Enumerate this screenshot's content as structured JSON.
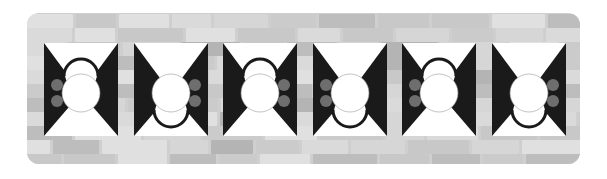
{
  "figure": {
    "colors": {
      "background": "#ffffff",
      "wall": "#cfcfcf",
      "tile": "#ffffff",
      "triangle": "#1a1a1a",
      "dot": "#6e6e6e",
      "circle": "#ffffff"
    }
  },
  "tiles": [
    {
      "index": 1,
      "small_circle": "top",
      "dots": "left"
    },
    {
      "index": 2,
      "small_circle": "bottom",
      "dots": "right"
    },
    {
      "index": 3,
      "small_circle": "top",
      "dots": "right"
    },
    {
      "index": 4,
      "small_circle": "bottom",
      "dots": "left"
    },
    {
      "index": 5,
      "small_circle": "top",
      "dots": "left"
    },
    {
      "index": 6,
      "small_circle": "bottom",
      "dots": "right"
    }
  ]
}
